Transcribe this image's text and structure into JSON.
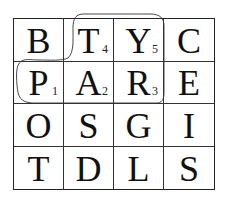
{
  "puzzle": {
    "type": "word-search-grid",
    "rows": 4,
    "cols": 4,
    "cells": [
      [
        {
          "letter": "B",
          "index": ""
        },
        {
          "letter": "T",
          "index": "4"
        },
        {
          "letter": "Y",
          "index": "5"
        },
        {
          "letter": "C",
          "index": ""
        }
      ],
      [
        {
          "letter": "P",
          "index": "1"
        },
        {
          "letter": "A",
          "index": "2"
        },
        {
          "letter": "R",
          "index": "3"
        },
        {
          "letter": "E",
          "index": ""
        }
      ],
      [
        {
          "letter": "O",
          "index": ""
        },
        {
          "letter": "S",
          "index": ""
        },
        {
          "letter": "G",
          "index": ""
        },
        {
          "letter": "I",
          "index": ""
        }
      ],
      [
        {
          "letter": "T",
          "index": ""
        },
        {
          "letter": "D",
          "index": ""
        },
        {
          "letter": "L",
          "index": ""
        },
        {
          "letter": "S",
          "index": ""
        }
      ]
    ],
    "highlighted_word": "PARTY",
    "highlighted_path_order": [
      "P",
      "A",
      "R",
      "T",
      "Y"
    ]
  }
}
